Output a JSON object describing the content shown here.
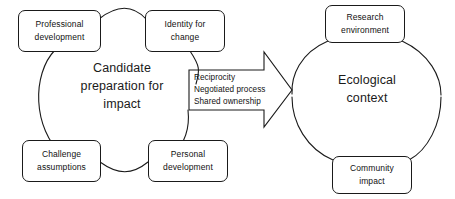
{
  "diagram": {
    "stroke_color": "#1a1a1a",
    "background_color": "#ffffff",
    "text_color": "#111111"
  },
  "left_cluster": {
    "hub": {
      "lines": [
        "Candidate",
        "preparation for",
        "impact"
      ]
    },
    "nodes": [
      {
        "id": "professional-development",
        "lines": [
          "Professional",
          "development"
        ]
      },
      {
        "id": "identity-for-change",
        "lines": [
          "Identity for",
          "change"
        ]
      },
      {
        "id": "challenge-assumptions",
        "lines": [
          "Challenge",
          "assumptions"
        ]
      },
      {
        "id": "personal-development",
        "lines": [
          "Personal",
          "development"
        ]
      }
    ]
  },
  "connector": {
    "shape": "right-arrow",
    "lines": [
      "Reciprocity",
      "Negotiated process",
      "Shared ownership"
    ]
  },
  "right_cluster": {
    "hub": {
      "lines": [
        "Ecological",
        "context"
      ]
    },
    "nodes": [
      {
        "id": "research-environment",
        "lines": [
          "Research",
          "environment"
        ]
      },
      {
        "id": "community-impact",
        "lines": [
          "Community",
          "impact"
        ]
      }
    ]
  }
}
